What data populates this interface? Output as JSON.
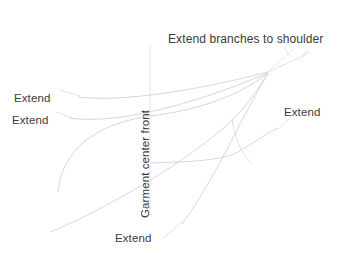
{
  "diagram": {
    "title": "Extend branches to shoulder",
    "background_color": "#ffffff",
    "text_color": "#3b3b3b",
    "line_color": "#cfcfcf",
    "labels": [
      {
        "name": "title",
        "text": "Extend branches to shoulder",
        "x": 168,
        "y": 33
      },
      {
        "name": "extend-upper-left",
        "text": "Extend",
        "x": 14,
        "y": 92
      },
      {
        "name": "extend-lower-left",
        "text": "Extend",
        "x": 12,
        "y": 114
      },
      {
        "name": "extend-right",
        "text": "Extend",
        "x": 284,
        "y": 106
      },
      {
        "name": "extend-bottom",
        "text": "Extend",
        "x": 115,
        "y": 232
      },
      {
        "name": "center-front-axis",
        "text": "Garment center front",
        "x": 139,
        "y": 218
      }
    ],
    "axis": {
      "label": "Garment center front",
      "orientation": "vertical",
      "x": 150,
      "y_top": 45,
      "y_bottom": 215
    },
    "leader_lines": [
      {
        "name": "leader-upper-left",
        "from_x": 60,
        "from_y": 90,
        "to_x": 80,
        "to_y": 96
      },
      {
        "name": "leader-lower-left",
        "from_x": 56,
        "from_y": 112,
        "to_x": 72,
        "to_y": 118
      },
      {
        "name": "leader-right",
        "from_x": 290,
        "from_y": 116,
        "to_x": 276,
        "to_y": 130
      },
      {
        "name": "leader-bottom",
        "from_x": 163,
        "from_y": 236,
        "to_x": 182,
        "to_y": 222
      },
      {
        "name": "leader-title-a",
        "from_x": 283,
        "from_y": 48,
        "to_x": 290,
        "to_y": 58
      },
      {
        "name": "leader-title-b",
        "from_x": 307,
        "from_y": 50,
        "to_x": 300,
        "to_y": 60
      }
    ],
    "curves": [
      {
        "name": "branch-upper",
        "description": "long shallow curve from left label to convergence point"
      },
      {
        "name": "branch-second",
        "description": "second shallow curve from left label rising to convergence"
      },
      {
        "name": "branch-mid",
        "description": "mid curve sweeping from lower left up to convergence"
      },
      {
        "name": "branch-lower",
        "description": "lower long curve rising from bottom left"
      },
      {
        "name": "branch-steep",
        "description": "steep curve from bottom center up through convergence"
      },
      {
        "name": "branch-right-lower",
        "description": "curve from lower middle out to right label"
      },
      {
        "name": "branch-shoulder-a",
        "description": "thin branch extending up-right to shoulder"
      },
      {
        "name": "branch-shoulder-b",
        "description": "second thin branch extending up-right to shoulder"
      }
    ],
    "convergence_point": {
      "x": 268,
      "y": 72
    }
  }
}
